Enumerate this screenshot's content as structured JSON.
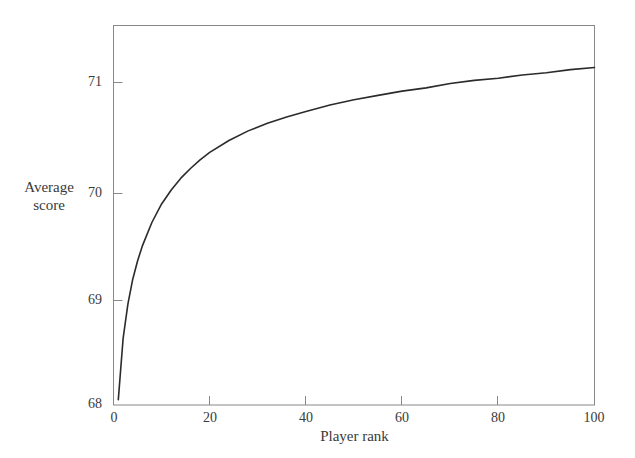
{
  "chart_data": {
    "type": "line",
    "title": "",
    "subtitle": "",
    "xlabel": "Player rank",
    "ylabel": "Average score",
    "ylabel_lines": [
      "Average",
      "score"
    ],
    "xlim": [
      0,
      100
    ],
    "ylim": [
      68,
      71.5
    ],
    "xticks": [
      0,
      20,
      40,
      60,
      80,
      100
    ],
    "xtick_labels": [
      "0",
      "20",
      "40",
      "60",
      "80",
      "100"
    ],
    "yticks": [
      68,
      69,
      70,
      71
    ],
    "ytick_labels": [
      "68",
      "69",
      "70",
      "71"
    ],
    "grid": false,
    "legend": null,
    "frame": "full-box",
    "tick_direction": "in",
    "series": [
      {
        "name": "Average score by player rank",
        "color": "#2b2b2b",
        "x": [
          1,
          2,
          3,
          4,
          5,
          6,
          8,
          10,
          12,
          14,
          16,
          18,
          20,
          24,
          28,
          32,
          36,
          40,
          45,
          50,
          55,
          60,
          65,
          70,
          75,
          80,
          85,
          90,
          95,
          100
        ],
        "y": [
          68.05,
          68.62,
          68.94,
          69.17,
          69.34,
          69.48,
          69.7,
          69.87,
          70.0,
          70.11,
          70.2,
          70.28,
          70.35,
          70.46,
          70.55,
          70.62,
          70.68,
          70.73,
          70.79,
          70.84,
          70.88,
          70.92,
          70.95,
          70.99,
          71.02,
          71.04,
          71.07,
          71.09,
          71.12,
          71.14
        ]
      }
    ]
  },
  "axes": {
    "y_axis_name": "average-score-axis",
    "x_axis_name": "player-rank-axis"
  }
}
